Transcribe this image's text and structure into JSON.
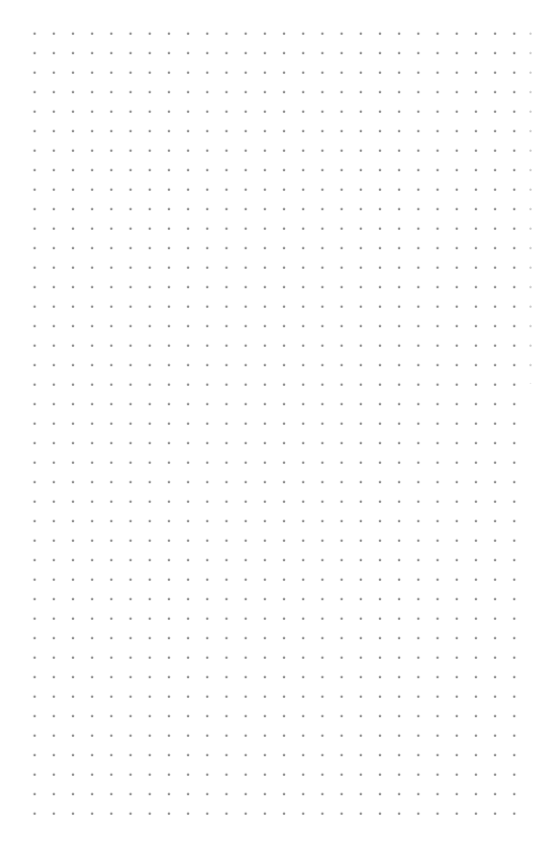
{
  "page": {
    "type": "dot-grid-paper",
    "background_color": "#ffffff",
    "dot_color": "#8a8a8a",
    "grid": {
      "columns": 26,
      "rows": 42,
      "spacing_x_px": 19.2,
      "spacing_y_px": 19.5,
      "first_dot": [
        34,
        33
      ],
      "last_dot": [
        514,
        814
      ]
    }
  }
}
